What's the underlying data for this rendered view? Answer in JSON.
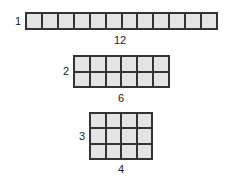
{
  "arrays": [
    {
      "rows": 1,
      "cols": 12,
      "row_label": "1",
      "col_label": "12"
    },
    {
      "rows": 2,
      "cols": 6,
      "row_label": "2",
      "col_label": "6"
    },
    {
      "rows": 3,
      "cols": 4,
      "row_label": "3",
      "col_label": "4"
    }
  ],
  "colors": {
    "cell_fill": "#e4e4e4",
    "grid_line": "#333333"
  }
}
